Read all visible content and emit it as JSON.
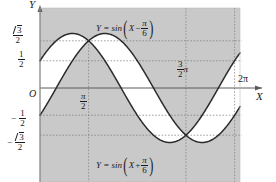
{
  "chart_data": {
    "type": "line",
    "title": "",
    "xlabel": "X",
    "ylabel": "Y",
    "xlim": [
      0,
      6.4577
    ],
    "ylim": [
      -1.22,
      1.22
    ],
    "grid": "dotted",
    "legend": "inline-annotations",
    "background": "#c9c9c9",
    "plot_fill_between": "#ffffff",
    "curve_color": "#2b2b2b",
    "series": [
      {
        "name": "Y = sin(X - pi/6)",
        "formula": "sin(x - 0.5235987755982988)",
        "phase": -0.5235987755982988,
        "amplitude": 1,
        "label": "Y = sin(X - π/6)",
        "key_points": [
          {
            "x": 0,
            "y": -0.5
          },
          {
            "x": 0.5235987755982988,
            "y": 0
          },
          {
            "x": 2.0943951023931953,
            "y": 1
          },
          {
            "x": 3.6651914291880923,
            "y": 0
          },
          {
            "x": 5.235987755982989,
            "y": -1
          },
          {
            "x": 6.283185307179586,
            "y": -0.5
          }
        ]
      },
      {
        "name": "Y = sin(X + pi/6)",
        "formula": "sin(x + 0.5235987755982988)",
        "phase": 0.5235987755982988,
        "amplitude": 1,
        "label": "Y = sin(X + π/6)",
        "key_points": [
          {
            "x": 0,
            "y": 0.5
          },
          {
            "x": 1.0471975511965976,
            "y": 1
          },
          {
            "x": 2.6179938779914944,
            "y": 0
          },
          {
            "x": 4.1887902047863905,
            "y": -1
          },
          {
            "x": 5.759586531581287,
            "y": 0
          },
          {
            "x": 6.283185307179586,
            "y": 0.5
          }
        ]
      }
    ],
    "intersections": [
      {
        "x": 1.5707963267948966,
        "y": 0.8660254037844387,
        "label": "pi/2 at sqrt3/2"
      },
      {
        "x": 4.71238898038469,
        "y": -0.8660254037844387,
        "label": "3pi/2 at -sqrt3/2"
      }
    ],
    "y_gridlines": [
      0.8660254037844387,
      0.5,
      -0.5,
      -0.8660254037844387
    ],
    "x_gridlines": [
      1.5707963267948966,
      4.71238898038469,
      6.283185307179586
    ]
  },
  "axes": {
    "y_axis_label": "Y",
    "x_axis_label": "X",
    "origin_label": "O",
    "y_ticks": [
      {
        "id": "sqrt3_over_2",
        "numerator": "3",
        "denominator": "2",
        "radical": true,
        "negative": false,
        "value": 0.866
      },
      {
        "id": "one_half",
        "numerator": "1",
        "denominator": "2",
        "radical": false,
        "negative": false,
        "value": 0.5
      },
      {
        "id": "neg_one_half",
        "numerator": "1",
        "denominator": "2",
        "radical": false,
        "negative": true,
        "value": -0.5
      },
      {
        "id": "neg_sqrt3_over_2",
        "numerator": "3",
        "denominator": "2",
        "radical": true,
        "negative": true,
        "value": -0.866
      }
    ],
    "x_ticks": [
      {
        "id": "pi_over_2",
        "numerator": "π",
        "denominator": "2",
        "value": 1.5708
      },
      {
        "id": "three_pi_over_2",
        "numerator": "3",
        "denominator": "2",
        "suffix": "π",
        "value": 4.7124
      },
      {
        "id": "two_pi",
        "text": "2π",
        "value": 6.2832
      }
    ]
  },
  "annotations": {
    "upper_curve": {
      "prefix": "Y = sin",
      "arg_variable": "X",
      "operator": "−",
      "frac_num": "π",
      "frac_den": "6"
    },
    "lower_curve": {
      "prefix": "Y = sin",
      "arg_variable": "X",
      "operator": "+",
      "frac_num": "π",
      "frac_den": "6"
    }
  },
  "colors": {
    "shaded_region": "#c9c9c9",
    "white_region": "#ffffff",
    "curve": "#2b2b2b",
    "axis": "#555555",
    "grid": "#8c8c8c",
    "text": "#1a1a1a"
  }
}
